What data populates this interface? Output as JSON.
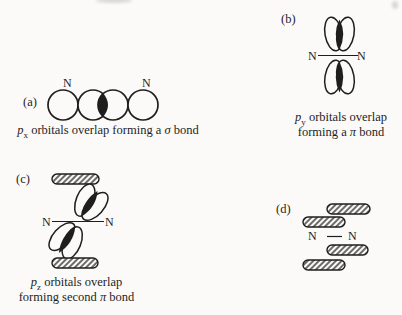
{
  "colors": {
    "ink": "#1e1e1e",
    "paper": "#fbfaf8"
  },
  "panels": {
    "a": {
      "label": "(a)",
      "atom_left": "N",
      "atom_right": "N",
      "caption": {
        "orbital": "p",
        "axis": "x",
        "mid": " orbitals overlap forming a ",
        "greek": "σ",
        "tail": " bond"
      }
    },
    "b": {
      "label": "(b)",
      "atom_left": "N",
      "atom_right": "N",
      "caption_line1": {
        "orbital": "p",
        "axis": "y",
        "rest": " orbitals overlap"
      },
      "caption_line2": {
        "pre": "forming a ",
        "greek": "π",
        "tail": " bond"
      }
    },
    "c": {
      "label": "(c)",
      "atom_left": "N",
      "atom_right": "N",
      "caption_line1": {
        "orbital": "p",
        "axis": "z",
        "rest": " orbitals overlap"
      },
      "caption_line2": {
        "pre": "forming second ",
        "greek": "π",
        "tail": " bond"
      }
    },
    "d": {
      "label": "(d)",
      "atom_left": "N",
      "atom_right": "N"
    }
  }
}
